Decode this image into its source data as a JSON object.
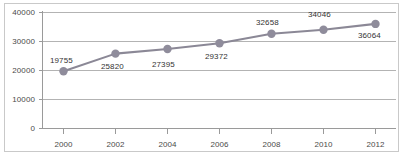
{
  "chart_data": {
    "type": "line",
    "title": "",
    "xlabel": "",
    "ylabel": "",
    "categories": [
      "2000",
      "2002",
      "2004",
      "2006",
      "2008",
      "2010",
      "2012"
    ],
    "x": [
      2000,
      2002,
      2004,
      2006,
      2008,
      2010,
      2012
    ],
    "values": [
      19755,
      25820,
      27395,
      29372,
      32658,
      34046,
      36064
    ],
    "point_labels": [
      "19755",
      "25820",
      "27395",
      "29372",
      "32658",
      "34046",
      "36064"
    ],
    "ylim": [
      0,
      40000
    ],
    "yticks": [
      0,
      10000,
      20000,
      30000,
      40000
    ],
    "ytick_labels": [
      "0",
      "10000",
      "20000",
      "30000",
      "40000"
    ],
    "xtick_labels": [
      "2000",
      "2002",
      "2004",
      "2006",
      "2008",
      "2010",
      "2012"
    ],
    "grid": true,
    "legend": "none",
    "series_color": "#8b8896",
    "marker_color": "#8f8c9b",
    "gridline_color": "#b3b3b3",
    "axis_color": "#9a9a9a",
    "label_color": "#4a4a4a",
    "background_color": "#ffffff",
    "border_color": "#c9c9c9",
    "marker_shape": "circle"
  }
}
